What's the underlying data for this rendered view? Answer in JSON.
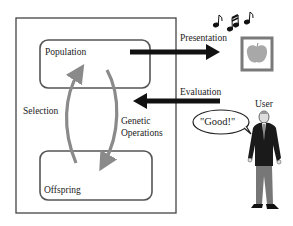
{
  "diagram": {
    "type": "interactive-evolutionary-computation",
    "system_box": {
      "population_label": "Population",
      "offspring_label": "Offspring",
      "selection_label": "Selection",
      "genetic_operations_label_line1": "Genetic",
      "genetic_operations_label_line2": "Operations"
    },
    "arrows": {
      "presentation_label": "Presentation",
      "evaluation_label": "Evaluation"
    },
    "user": {
      "label": "User",
      "speech": "\"Good!\""
    },
    "icons": [
      "music-notes-icon",
      "apple-picture-icon",
      "user-person-icon"
    ],
    "colors": {
      "box_stroke": "#555555",
      "cycle_arrow": "#8a8a8a",
      "flow_arrow": "#111111",
      "apple_frame": "#7a7a7a",
      "apple_fill": "#a8a8a8"
    }
  }
}
